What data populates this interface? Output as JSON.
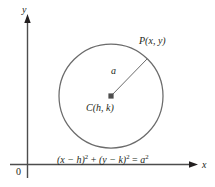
{
  "figure": {
    "type": "geometry-diagram",
    "axes": {
      "y_label": "y",
      "x_label": "x",
      "origin_label": "0"
    },
    "labels": {
      "point_p": "P(x, y)",
      "center": "C(h, k)",
      "radius": "a"
    },
    "equation": {
      "full_text": "(x − h)² + (y − k)² = a²",
      "left_base": "(x − h)",
      "left_exponent": "2",
      "plus": "+",
      "mid_base": "(y − k)",
      "mid_exponent": "2",
      "equals": "=",
      "right_base": "a",
      "right_exponent": "2"
    },
    "colors": {
      "ink": "#231f20",
      "stroke": "#4d4d4d",
      "background": "#ffffff"
    },
    "geometry": {
      "circle_center_x": 111,
      "circle_center_y": 96,
      "circle_radius": 52,
      "point_p_x": 147,
      "point_p_y": 59
    }
  }
}
